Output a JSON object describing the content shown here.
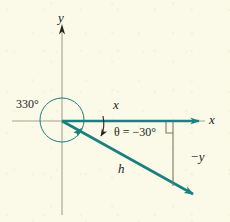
{
  "figure": {
    "background_color": "#fbfae9",
    "vector_color": "#1b7f7f",
    "axis_color": "#9b9a86",
    "text_color": "#22221e",
    "labels": {
      "y_axis": "y",
      "x_axis": "x",
      "coterminal_angle": "330°",
      "x_component": "x",
      "theta": "θ = −30°",
      "negative_y": "−y",
      "hypotenuse": "h"
    },
    "geometry": {
      "origin": [
        62,
        121
      ],
      "y_axis_top": [
        62,
        26
      ],
      "y_axis_bottom": [
        62,
        215
      ],
      "x_axis_left": [
        12,
        121
      ],
      "x_axis_right": [
        205,
        121
      ],
      "x_vector_end": [
        203,
        121
      ],
      "h_vector_end": [
        198,
        197
      ],
      "drop_line_top": [
        173,
        121
      ],
      "drop_line_bottom": [
        173,
        185
      ],
      "circle_center": [
        62,
        120
      ],
      "circle_radius": 22,
      "theta_degrees": -30,
      "coterminal_degrees": 330
    }
  }
}
